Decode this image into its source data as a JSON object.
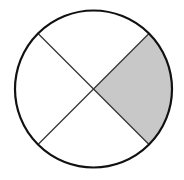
{
  "diagram": {
    "type": "fraction-circle",
    "total_parts": 4,
    "shaded_parts": 1,
    "shaded_position": "right",
    "colors": {
      "background": "#ffffff",
      "outline": "#111111",
      "divider": "#333333",
      "shade": "#c8c8c8"
    }
  }
}
